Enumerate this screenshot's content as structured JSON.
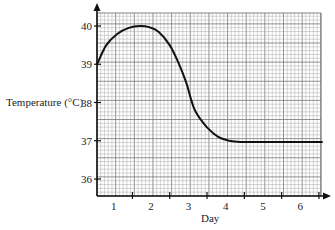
{
  "chart_data": {
    "type": "line",
    "title": "",
    "xlabel": "Day",
    "ylabel": "Temperature (°C)",
    "x_ticks": [
      1,
      2,
      3,
      4,
      5,
      6
    ],
    "y_ticks": [
      36,
      37,
      38,
      39,
      40
    ],
    "xlim": [
      0.55,
      6.6
    ],
    "ylim": [
      35.6,
      40.4
    ],
    "grid": true,
    "legend": null,
    "series": [
      {
        "name": "Temperature",
        "x": [
          0.55,
          0.8,
          1.1,
          1.4,
          1.7,
          1.95,
          2.2,
          2.5,
          2.75,
          2.95,
          3.05,
          3.2,
          3.5,
          3.8,
          4.1,
          4.4,
          5.0,
          5.5,
          6.0,
          6.6
        ],
        "values": [
          39.0,
          39.5,
          39.8,
          39.95,
          40.0,
          39.97,
          39.85,
          39.5,
          39.0,
          38.5,
          38.15,
          37.75,
          37.35,
          37.1,
          37.0,
          36.97,
          36.97,
          36.97,
          36.97,
          36.97
        ]
      }
    ]
  },
  "labels": {
    "y_axis_title": "Temperature (°C)",
    "x_axis_title": "Day",
    "y_tick_labels": [
      "40",
      "39",
      "38",
      "37",
      "36"
    ],
    "x_tick_labels": [
      "1",
      "2",
      "3",
      "4",
      "5",
      "6"
    ]
  }
}
